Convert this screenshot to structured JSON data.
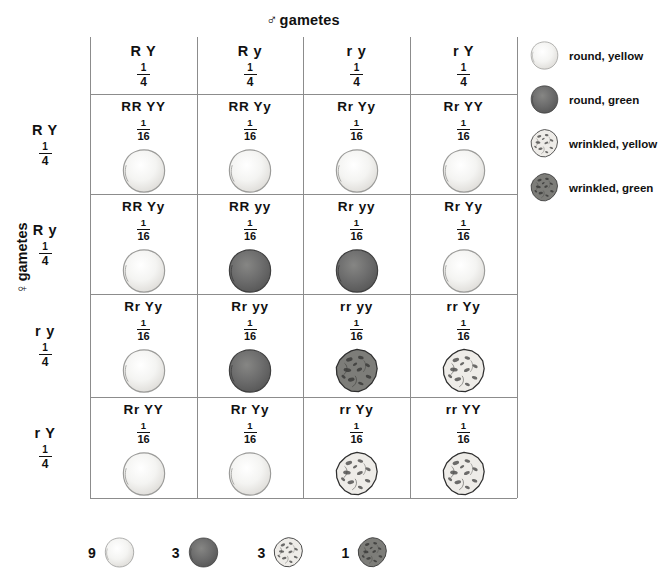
{
  "title": {
    "male_gametes": "gametes",
    "male_symbol": "♂",
    "female_gametes": "gametes",
    "female_symbol": "♀"
  },
  "colors": {
    "grid_line": "#8c8c8c",
    "text": "#111111",
    "round_yellow": "#f2f2f0",
    "round_green": "#6d6d6d",
    "wrinkled_yellow": "#e8e7e4",
    "wrinkled_green": "#7a7a76",
    "outline": "#3a3a3a"
  },
  "columns": [
    {
      "gametes": "R Y",
      "fraction_num": "1",
      "fraction_den": "4"
    },
    {
      "gametes": "R y",
      "fraction_num": "1",
      "fraction_den": "4"
    },
    {
      "gametes": "r y",
      "fraction_num": "1",
      "fraction_den": "4"
    },
    {
      "gametes": "r Y",
      "fraction_num": "1",
      "fraction_den": "4"
    }
  ],
  "rows": [
    {
      "gametes": "R Y",
      "fraction_num": "1",
      "fraction_den": "4"
    },
    {
      "gametes": "R y",
      "fraction_num": "1",
      "fraction_den": "4"
    },
    {
      "gametes": "r y",
      "fraction_num": "1",
      "fraction_den": "4"
    },
    {
      "gametes": "r Y",
      "fraction_num": "1",
      "fraction_den": "4"
    }
  ],
  "cells": [
    {
      "genotype": "RR YY",
      "fraction_num": "1",
      "fraction_den": "16",
      "phenotype": "round, yellow"
    },
    {
      "genotype": "RR Yy",
      "fraction_num": "1",
      "fraction_den": "16",
      "phenotype": "round, yellow"
    },
    {
      "genotype": "Rr Yy",
      "fraction_num": "1",
      "fraction_den": "16",
      "phenotype": "round, yellow"
    },
    {
      "genotype": "Rr YY",
      "fraction_num": "1",
      "fraction_den": "16",
      "phenotype": "round, yellow"
    },
    {
      "genotype": "RR Yy",
      "fraction_num": "1",
      "fraction_den": "16",
      "phenotype": "round, yellow"
    },
    {
      "genotype": "RR yy",
      "fraction_num": "1",
      "fraction_den": "16",
      "phenotype": "round, green"
    },
    {
      "genotype": "Rr yy",
      "fraction_num": "1",
      "fraction_den": "16",
      "phenotype": "round, green"
    },
    {
      "genotype": "Rr Yy",
      "fraction_num": "1",
      "fraction_den": "16",
      "phenotype": "round, yellow"
    },
    {
      "genotype": "Rr Yy",
      "fraction_num": "1",
      "fraction_den": "16",
      "phenotype": "round, yellow"
    },
    {
      "genotype": "Rr yy",
      "fraction_num": "1",
      "fraction_den": "16",
      "phenotype": "round, green"
    },
    {
      "genotype": "rr yy",
      "fraction_num": "1",
      "fraction_den": "16",
      "phenotype": "wrinkled, green"
    },
    {
      "genotype": "rr Yy",
      "fraction_num": "1",
      "fraction_den": "16",
      "phenotype": "wrinkled, yellow"
    },
    {
      "genotype": "Rr YY",
      "fraction_num": "1",
      "fraction_den": "16",
      "phenotype": "round, yellow"
    },
    {
      "genotype": "Rr Yy",
      "fraction_num": "1",
      "fraction_den": "16",
      "phenotype": "round, yellow"
    },
    {
      "genotype": "rr Yy",
      "fraction_num": "1",
      "fraction_den": "16",
      "phenotype": "wrinkled, yellow"
    },
    {
      "genotype": "rr YY",
      "fraction_num": "1",
      "fraction_den": "16",
      "phenotype": "wrinkled, yellow"
    }
  ],
  "legend": [
    {
      "label": "round, yellow",
      "phenotype": "round, yellow"
    },
    {
      "label": "round, green",
      "phenotype": "round, green"
    },
    {
      "label": "wrinkled, yellow",
      "phenotype": "wrinkled, yellow"
    },
    {
      "label": "wrinkled, green",
      "phenotype": "wrinkled, green"
    }
  ],
  "ratio": [
    {
      "count": "9",
      "phenotype": "round, yellow"
    },
    {
      "count": "3",
      "phenotype": "round, green"
    },
    {
      "count": "3",
      "phenotype": "wrinkled, yellow"
    },
    {
      "count": "1",
      "phenotype": "wrinkled, green"
    }
  ]
}
